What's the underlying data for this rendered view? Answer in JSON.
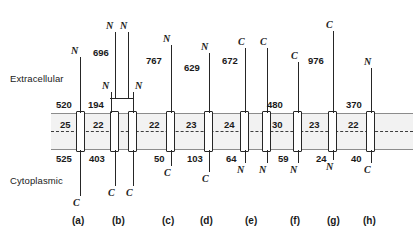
{
  "figure": {
    "side_labels": {
      "extracellular": "Extracellular",
      "cytoplasmic": "Cytoplasmic"
    }
  },
  "panels": [
    {
      "id": "a",
      "letter": "(a)",
      "helix_count": 1,
      "tm_lengths": [
        "25"
      ],
      "extracellular_length": "520",
      "cytoplasmic_length": "525",
      "n_terminus_side": "extracellular",
      "c_terminus_side": "cytoplasmic",
      "terminus_labels": [
        "N",
        "C"
      ]
    },
    {
      "id": "b",
      "letter": "(b)",
      "helix_count": 2,
      "tm_lengths": [
        "22"
      ],
      "extracellular_length": "194",
      "extracellular_long_length": "696",
      "cytoplasmic_length": "403",
      "n_terminus_side": "extracellular",
      "c_terminus_side": "cytoplasmic",
      "terminus_labels": [
        "N",
        "N",
        "N",
        "N",
        "C",
        "C"
      ]
    },
    {
      "id": "c",
      "letter": "(c)",
      "helix_count": 1,
      "tm_lengths": [
        "22"
      ],
      "extracellular_length": "767",
      "cytoplasmic_length": "50",
      "n_terminus_side": "extracellular",
      "c_terminus_side": "cytoplasmic",
      "terminus_labels": [
        "N",
        "C"
      ]
    },
    {
      "id": "d",
      "letter": "(d)",
      "helix_count": 1,
      "tm_lengths": [
        "23"
      ],
      "extracellular_length": "629",
      "cytoplasmic_length": "103",
      "n_terminus_side": "extracellular",
      "c_terminus_side": "cytoplasmic",
      "terminus_labels": [
        "N",
        "C"
      ]
    },
    {
      "id": "e",
      "letter": "(e)",
      "helix_count": 2,
      "tm_lengths": [
        "24"
      ],
      "extracellular_length": "672",
      "cytoplasmic_length": "64",
      "n_terminus_side": "cytoplasmic",
      "c_terminus_side": "extracellular",
      "terminus_labels": [
        "C",
        "C",
        "N",
        "N"
      ]
    },
    {
      "id": "f",
      "letter": "(f)",
      "helix_count": 1,
      "tm_lengths": [
        "30"
      ],
      "extracellular_length": "480",
      "cytoplasmic_length": "59",
      "n_terminus_side": "cytoplasmic",
      "c_terminus_side": "extracellular",
      "terminus_labels": [
        "C",
        "N"
      ]
    },
    {
      "id": "g",
      "letter": "(g)",
      "helix_count": 1,
      "tm_lengths": [
        "23"
      ],
      "extracellular_length": "976",
      "cytoplasmic_length": "24",
      "n_terminus_side": "cytoplasmic",
      "c_terminus_side": "extracellular",
      "terminus_labels": [
        "C",
        "N"
      ]
    },
    {
      "id": "h",
      "letter": "(h)",
      "helix_count": 1,
      "tm_lengths": [
        "22"
      ],
      "extracellular_length": "370",
      "cytoplasmic_length": "40",
      "n_terminus_side": "extracellular",
      "c_terminus_side": "cytoplasmic",
      "terminus_labels": [
        "N",
        "C"
      ]
    }
  ],
  "text": {
    "extracellular": "Extracellular",
    "cytoplasmic": "Cytoplasmic",
    "n": "N",
    "c": "C",
    "num_520": "520",
    "num_525": "525",
    "num_25": "25",
    "num_696": "696",
    "num_194": "194",
    "num_22b": "22",
    "num_403": "403",
    "num_767": "767",
    "num_22c": "22",
    "num_50": "50",
    "num_629": "629",
    "num_23d": "23",
    "num_103": "103",
    "num_672": "672",
    "num_24e": "24",
    "num_64": "64",
    "num_480": "480",
    "num_30": "30",
    "num_59": "59",
    "num_976": "976",
    "num_23g": "23",
    "num_24g": "24",
    "num_370": "370",
    "num_22h": "22",
    "num_40": "40",
    "letter_a": "(a)",
    "letter_b": "(b)",
    "letter_c": "(c)",
    "letter_d": "(d)",
    "letter_e": "(e)",
    "letter_f": "(f)",
    "letter_g": "(g)",
    "letter_h": "(h)"
  },
  "colors": {
    "membrane_fill": "#f2f2f2",
    "membrane_border": "#8c8c8c",
    "midline": "#3d3d3d",
    "stroke": "#262626",
    "text": "#1a1a1a"
  }
}
